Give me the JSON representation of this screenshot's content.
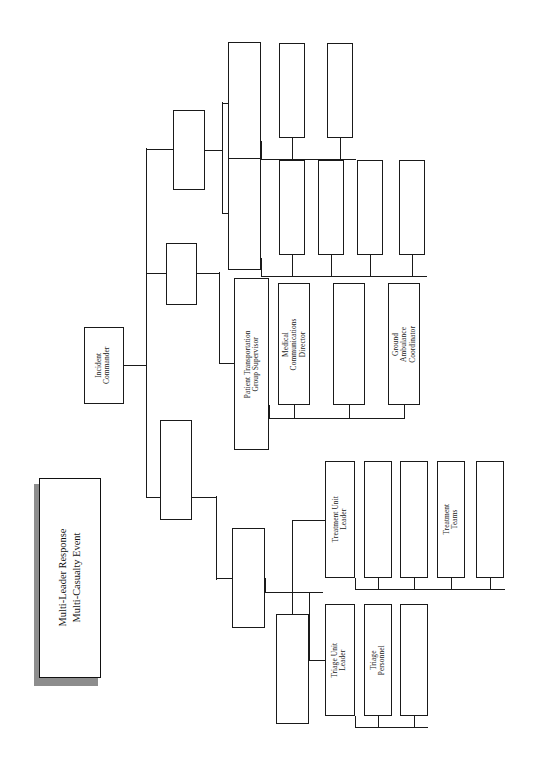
{
  "document": {
    "kind": "organizational-chart",
    "orientation": "rotated-90-ccw",
    "title_line_1": "Multi-Leader Response",
    "title_line_2": "Multi-Casualty Event"
  },
  "title_block": {
    "text": "Multi-Leader Response\nMulti-Casualty Event"
  },
  "colors": {
    "box_border": "#1a1a1a",
    "box_fill": "#ffffff",
    "line": "#1a1a1a",
    "shadow": "#8d8d8d",
    "page": "#ffffff"
  },
  "nodes": [
    {
      "id": "incident-commander",
      "label": "Incident\nCommander",
      "x": 84,
      "y": 327,
      "w": 40,
      "h": 77
    },
    {
      "id": "branch-a",
      "label": "",
      "x": 173,
      "y": 110,
      "w": 32,
      "h": 80
    },
    {
      "id": "branch-b",
      "label": "",
      "x": 166,
      "y": 243,
      "w": 31,
      "h": 62
    },
    {
      "id": "branch-c",
      "label": "",
      "x": 160,
      "y": 420,
      "w": 32,
      "h": 100
    },
    {
      "id": "branch-d",
      "label": "",
      "x": 228,
      "y": 42,
      "w": 33,
      "h": 120
    },
    {
      "id": "branch-e",
      "label": "",
      "x": 228,
      "y": 158,
      "w": 33,
      "h": 112
    },
    {
      "id": "patient-transportation",
      "label": "Patient Transportation\nGroup Supervisor",
      "x": 234,
      "y": 278,
      "w": 35,
      "h": 172
    },
    {
      "id": "unit-group-f",
      "label": "",
      "x": 232,
      "y": 528,
      "w": 33,
      "h": 100
    },
    {
      "id": "unit-group-g",
      "label": "",
      "x": 276,
      "y": 614,
      "w": 33,
      "h": 110
    },
    {
      "id": "child-d1",
      "label": "",
      "x": 279,
      "y": 43,
      "w": 26,
      "h": 95
    },
    {
      "id": "child-d2",
      "label": "",
      "x": 327,
      "y": 43,
      "w": 26,
      "h": 95
    },
    {
      "id": "child-e1",
      "label": "",
      "x": 279,
      "y": 160,
      "w": 26,
      "h": 95
    },
    {
      "id": "child-e2",
      "label": "",
      "x": 318,
      "y": 160,
      "w": 26,
      "h": 95
    },
    {
      "id": "child-e3",
      "label": "",
      "x": 357,
      "y": 160,
      "w": 26,
      "h": 95
    },
    {
      "id": "child-e4",
      "label": "",
      "x": 399,
      "y": 160,
      "w": 26,
      "h": 95
    },
    {
      "id": "medical-communications",
      "label": "Medical\nCommunications\nDirector",
      "x": 278,
      "y": 283,
      "w": 32,
      "h": 122
    },
    {
      "id": "transport-child-2",
      "label": "",
      "x": 333,
      "y": 283,
      "w": 32,
      "h": 122
    },
    {
      "id": "ground-ambulance",
      "label": "Ground\nAmbulance\nCoordinator",
      "x": 388,
      "y": 283,
      "w": 32,
      "h": 122
    },
    {
      "id": "treatment-unit-leader",
      "label": "Treatment Unit\nLeader",
      "x": 325,
      "y": 461,
      "w": 30,
      "h": 117
    },
    {
      "id": "treatment-child-1",
      "label": "",
      "x": 364,
      "y": 461,
      "w": 28,
      "h": 117
    },
    {
      "id": "treatment-child-2",
      "label": "",
      "x": 400,
      "y": 461,
      "w": 28,
      "h": 117
    },
    {
      "id": "treatment-teams",
      "label": "Treatment\nTeams",
      "x": 437,
      "y": 461,
      "w": 28,
      "h": 117
    },
    {
      "id": "treatment-child-4",
      "label": "",
      "x": 476,
      "y": 461,
      "w": 28,
      "h": 117
    },
    {
      "id": "triage-unit-leader",
      "label": "Triage Unit\nLeader",
      "x": 325,
      "y": 604,
      "w": 30,
      "h": 112
    },
    {
      "id": "triage-personnel",
      "label": "Triage\nPersonnel",
      "x": 364,
      "y": 604,
      "w": 28,
      "h": 112
    },
    {
      "id": "triage-child-2",
      "label": "",
      "x": 400,
      "y": 604,
      "w": 28,
      "h": 112
    }
  ],
  "connectors": [
    {
      "id": "ic-out",
      "o": "h",
      "x": 124,
      "y": 365,
      "len": 22
    },
    {
      "id": "ic-spine",
      "o": "v",
      "x": 146,
      "y": 148,
      "len": 350
    },
    {
      "id": "ic-to-a",
      "o": "h",
      "x": 146,
      "y": 149,
      "len": 27
    },
    {
      "id": "ic-to-b",
      "o": "h",
      "x": 146,
      "y": 273,
      "len": 20
    },
    {
      "id": "ic-to-c",
      "o": "h",
      "x": 146,
      "y": 497,
      "len": 14
    },
    {
      "id": "a-out",
      "o": "h",
      "x": 205,
      "y": 150,
      "len": 17
    },
    {
      "id": "a-spine",
      "o": "v",
      "x": 222,
      "y": 102,
      "len": 112
    },
    {
      "id": "a-to-d",
      "o": "h",
      "x": 222,
      "y": 103,
      "len": 6
    },
    {
      "id": "a-to-e",
      "o": "h",
      "x": 222,
      "y": 213,
      "len": 6
    },
    {
      "id": "b-out",
      "o": "h",
      "x": 197,
      "y": 273,
      "len": 22
    },
    {
      "id": "b-spine",
      "o": "v",
      "x": 219,
      "y": 272,
      "len": 92
    },
    {
      "id": "b-to-t",
      "o": "h",
      "x": 219,
      "y": 363,
      "len": 15
    },
    {
      "id": "c-out",
      "o": "h",
      "x": 192,
      "y": 497,
      "len": 24
    },
    {
      "id": "c-spine",
      "o": "v",
      "x": 216,
      "y": 496,
      "len": 84
    },
    {
      "id": "c-to-f",
      "o": "h",
      "x": 216,
      "y": 578,
      "len": 16
    },
    {
      "id": "d-bus",
      "o": "h",
      "x": 261,
      "y": 159,
      "len": 95
    },
    {
      "id": "d-stem",
      "o": "v",
      "x": 261,
      "y": 141,
      "len": 19
    },
    {
      "id": "d-drop-1",
      "o": "v",
      "x": 292,
      "y": 138,
      "len": 22
    },
    {
      "id": "d-drop-2",
      "o": "v",
      "x": 340,
      "y": 138,
      "len": 22
    },
    {
      "id": "e-bus",
      "o": "h",
      "x": 261,
      "y": 276,
      "len": 166
    },
    {
      "id": "e-stem",
      "o": "v",
      "x": 261,
      "y": 258,
      "len": 19
    },
    {
      "id": "e-drop-1",
      "o": "v",
      "x": 292,
      "y": 255,
      "len": 22
    },
    {
      "id": "e-drop-2",
      "o": "v",
      "x": 331,
      "y": 255,
      "len": 22
    },
    {
      "id": "e-drop-3",
      "o": "v",
      "x": 370,
      "y": 255,
      "len": 22
    },
    {
      "id": "e-drop-4",
      "o": "v",
      "x": 412,
      "y": 255,
      "len": 22
    },
    {
      "id": "t-bus",
      "o": "h",
      "x": 269,
      "y": 418,
      "len": 135
    },
    {
      "id": "t-stem",
      "o": "v",
      "x": 269,
      "y": 405,
      "len": 14
    },
    {
      "id": "t-drop-1",
      "o": "v",
      "x": 294,
      "y": 405,
      "len": 14
    },
    {
      "id": "t-drop-2",
      "o": "v",
      "x": 349,
      "y": 405,
      "len": 14
    },
    {
      "id": "t-drop-3",
      "o": "v",
      "x": 404,
      "y": 405,
      "len": 14
    },
    {
      "id": "f-bus",
      "o": "h",
      "x": 265,
      "y": 592,
      "len": 58
    },
    {
      "id": "f-stem",
      "o": "v",
      "x": 265,
      "y": 578,
      "len": 15
    },
    {
      "id": "f-to-tu",
      "o": "v",
      "x": 292,
      "y": 520,
      "len": 73
    },
    {
      "id": "f-tu-arm",
      "o": "h",
      "x": 292,
      "y": 520,
      "len": 33
    },
    {
      "id": "f-to-g",
      "o": "v",
      "x": 292,
      "y": 592,
      "len": 22
    },
    {
      "id": "g-to-tr",
      "o": "h",
      "x": 309,
      "y": 660,
      "len": 16
    },
    {
      "id": "g-arm",
      "o": "v",
      "x": 309,
      "y": 592,
      "len": 69
    },
    {
      "id": "tul-bus",
      "o": "h",
      "x": 355,
      "y": 589,
      "len": 150
    },
    {
      "id": "tul-stem",
      "o": "v",
      "x": 355,
      "y": 578,
      "len": 12
    },
    {
      "id": "tul-drop-1",
      "o": "v",
      "x": 378,
      "y": 578,
      "len": 12
    },
    {
      "id": "tul-drop-2",
      "o": "v",
      "x": 414,
      "y": 578,
      "len": 12
    },
    {
      "id": "tul-drop-3",
      "o": "v",
      "x": 451,
      "y": 578,
      "len": 12
    },
    {
      "id": "tul-drop-4",
      "o": "v",
      "x": 490,
      "y": 578,
      "len": 12
    },
    {
      "id": "trl-bus",
      "o": "h",
      "x": 355,
      "y": 727,
      "len": 73
    },
    {
      "id": "trl-stem",
      "o": "v",
      "x": 355,
      "y": 716,
      "len": 12
    },
    {
      "id": "trl-drop-1",
      "o": "v",
      "x": 378,
      "y": 716,
      "len": 12
    },
    {
      "id": "trl-drop-2",
      "o": "v",
      "x": 414,
      "y": 716,
      "len": 12
    }
  ],
  "title_geometry": {
    "shadow": {
      "x": 34,
      "y": 484,
      "w": 62,
      "h": 200
    },
    "box": {
      "x": 39,
      "y": 478,
      "w": 62,
      "h": 200
    }
  }
}
